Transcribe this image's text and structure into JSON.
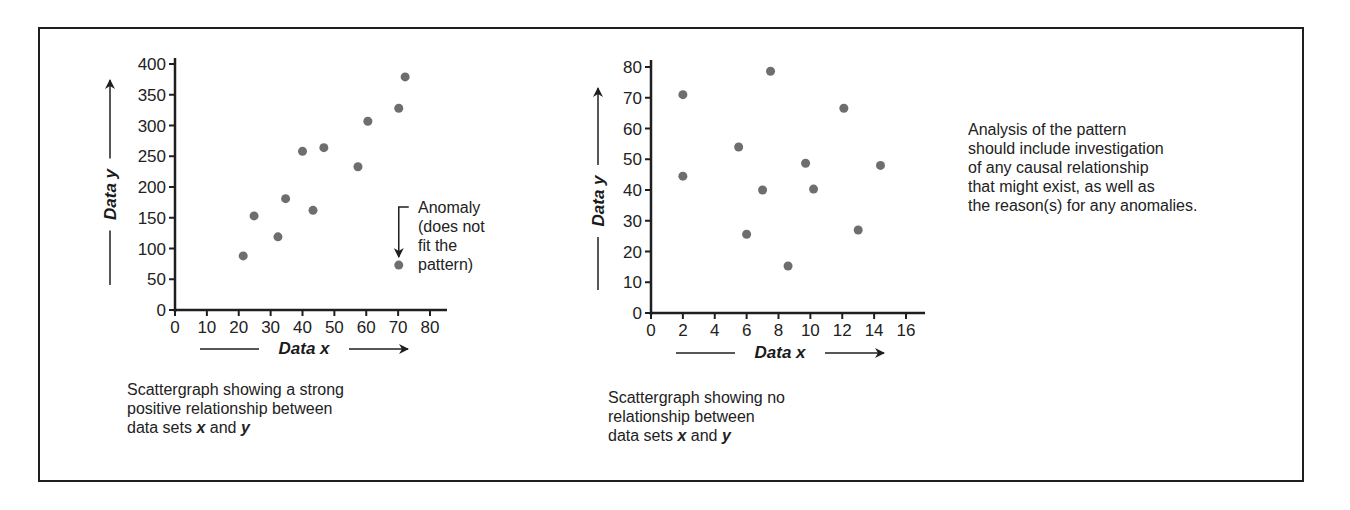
{
  "chart_data": [
    {
      "type": "scatter",
      "title": "",
      "xlabel": "Data x",
      "ylabel": "Data y",
      "xlim": [
        0,
        80
      ],
      "ylim": [
        0,
        400
      ],
      "xticks": [
        0,
        10,
        20,
        30,
        40,
        50,
        60,
        70,
        80
      ],
      "yticks": [
        0,
        50,
        100,
        150,
        200,
        250,
        300,
        350,
        400
      ],
      "grid": false,
      "points": [
        {
          "x": 21.4,
          "y": 88
        },
        {
          "x": 24.8,
          "y": 153
        },
        {
          "x": 32.3,
          "y": 119
        },
        {
          "x": 34.7,
          "y": 181
        },
        {
          "x": 40,
          "y": 258
        },
        {
          "x": 43.3,
          "y": 162
        },
        {
          "x": 46.7,
          "y": 264
        },
        {
          "x": 57.4,
          "y": 233
        },
        {
          "x": 60.5,
          "y": 307
        },
        {
          "x": 70.2,
          "y": 328
        },
        {
          "x": 72.2,
          "y": 379
        },
        {
          "x": 70.2,
          "y": 73,
          "anomaly": true
        }
      ],
      "annotation": {
        "lines": [
          "Anomaly",
          "(does not",
          "fit the",
          "pattern)"
        ],
        "target": {
          "x": 70.2,
          "y": 73
        }
      },
      "caption": {
        "line1": "Scattergraph showing a strong",
        "line2": "positive relationship between",
        "line3_pre": "data sets ",
        "var_x": "x",
        "line3_mid": " and ",
        "var_y": "y"
      }
    },
    {
      "type": "scatter",
      "title": "",
      "xlabel": "Data x",
      "ylabel": "Data y",
      "xlim": [
        0,
        16
      ],
      "ylim": [
        0,
        80
      ],
      "xticks": [
        0,
        2,
        4,
        6,
        8,
        10,
        12,
        14,
        16
      ],
      "yticks": [
        0,
        10,
        20,
        30,
        40,
        50,
        60,
        70,
        80
      ],
      "grid": false,
      "points": [
        {
          "x": 2.0,
          "y": 71
        },
        {
          "x": 2.0,
          "y": 44.5
        },
        {
          "x": 5.5,
          "y": 54
        },
        {
          "x": 6.0,
          "y": 25.6
        },
        {
          "x": 7.0,
          "y": 40
        },
        {
          "x": 7.5,
          "y": 78.6
        },
        {
          "x": 8.6,
          "y": 15.3
        },
        {
          "x": 9.7,
          "y": 48.7
        },
        {
          "x": 10.2,
          "y": 40.3
        },
        {
          "x": 12.1,
          "y": 66.6
        },
        {
          "x": 13.0,
          "y": 27
        },
        {
          "x": 14.4,
          "y": 48
        }
      ],
      "caption": {
        "line1": "Scattergraph showing no",
        "line2": "relationship between",
        "line3_pre": "data sets ",
        "var_x": "x",
        "line3_mid": " and ",
        "var_y": "y"
      }
    }
  ],
  "note": {
    "lines": [
      "Analysis of the pattern",
      "should include investigation",
      "of any causal relationship",
      "that might exist, as well as",
      "the reason(s) for any anomalies."
    ]
  },
  "colors": {
    "point": "#6e6e6e",
    "axis": "#1f1f1f",
    "text": "#222222"
  }
}
